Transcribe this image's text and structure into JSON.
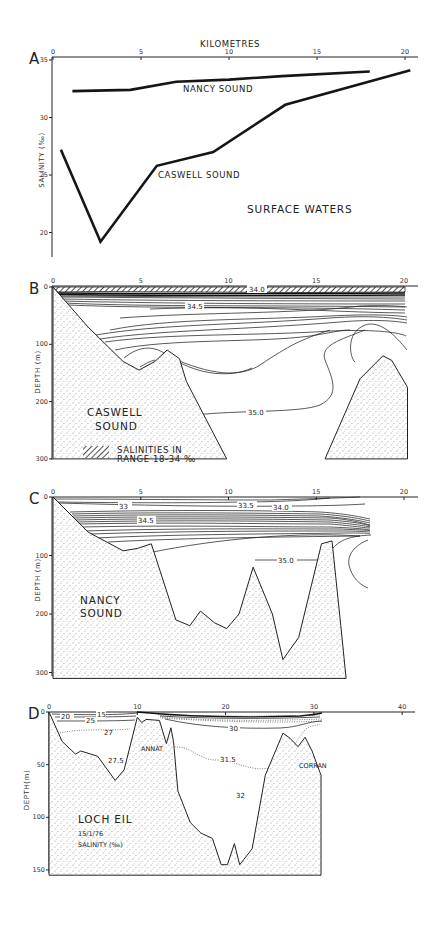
{
  "figure": {
    "panels": [
      "A",
      "B",
      "C",
      "D"
    ]
  },
  "chart_data": [
    {
      "panel": "A",
      "type": "line",
      "title": "SURFACE WATERS",
      "xlabel": "KILOMETRES",
      "ylabel": "SALINITY (‰)",
      "xlim": [
        0,
        21
      ],
      "ylim": [
        18,
        35
      ],
      "x_ticks": [
        "0",
        "5",
        "10",
        "15",
        "20"
      ],
      "y_ticks": [
        "35",
        "30",
        "25",
        "20"
      ],
      "grid": false,
      "series": [
        {
          "name": "NANCY SOUND",
          "x": [
            1.1,
            4.4,
            7.0,
            10.0,
            13.0,
            18.0
          ],
          "y": [
            32.3,
            32.4,
            33.1,
            33.3,
            33.6,
            34.0
          ]
        },
        {
          "name": "CASWELL SOUND",
          "x": [
            0.45,
            2.7,
            5.9,
            9.1,
            13.2,
            20.3
          ],
          "y": [
            27.2,
            19.2,
            25.8,
            27.0,
            31.1,
            34.1
          ]
        }
      ]
    },
    {
      "panel": "B",
      "type": "section",
      "title": "CASWELL SOUND",
      "xlabel": "KILOMETRES",
      "ylabel": "DEPTH (m)",
      "xlim": [
        0,
        21
      ],
      "ylim": [
        0,
        300
      ],
      "x_ticks": [
        "0",
        "5",
        "10",
        "15",
        "20"
      ],
      "y_ticks": [
        "0",
        "100",
        "200",
        "300"
      ],
      "isohaline_labels": [
        "34.0",
        "34.5",
        "35.0"
      ],
      "legend": {
        "hatch_label_line1": "SALINITIES IN",
        "hatch_label_line2": "RANGE 18-34 ‰"
      },
      "bathymetry": {
        "x": [
          0,
          2,
          4,
          4.9,
          5.8,
          6.5,
          7.2,
          7.6,
          9.9
        ],
        "depth": [
          0,
          70,
          130,
          145,
          130,
          110,
          125,
          165,
          300
        ]
      },
      "sill_2": {
        "x": [
          15.5,
          17.5,
          18.8,
          19.3,
          20.2
        ],
        "depth": [
          300,
          160,
          120,
          128,
          175
        ]
      }
    },
    {
      "panel": "C",
      "type": "section",
      "title": "NANCY SOUND",
      "xlabel": "KILOMETRES",
      "ylabel": "DEPTH (m)",
      "xlim": [
        0,
        21
      ],
      "ylim": [
        0,
        300
      ],
      "x_ticks": [
        "0",
        "5",
        "10",
        "15",
        "20"
      ],
      "y_ticks": [
        "0",
        "100",
        "200",
        "300"
      ],
      "isohaline_labels": [
        "33",
        "33.5",
        "34.0",
        "34.5",
        "35.0"
      ],
      "bathymetry": {
        "x": [
          0,
          2,
          4,
          4.8,
          5.6,
          7,
          7.8,
          8.4,
          9.2,
          9.9,
          10.6,
          11.4,
          12.5,
          13.1,
          14,
          15.3,
          15.9,
          16.4,
          16.7
        ],
        "depth": [
          0,
          60,
          92,
          88,
          80,
          210,
          220,
          195,
          215,
          225,
          200,
          120,
          200,
          278,
          240,
          80,
          75,
          220,
          310
        ]
      }
    },
    {
      "panel": "D",
      "type": "section",
      "title": "LOCH EIL",
      "subtitle": "15/1/76",
      "caption": "SALINITY (‰)",
      "xlabel": "",
      "ylabel": "DEPTH(m)",
      "xlim": [
        0,
        42
      ],
      "ylim": [
        0,
        155
      ],
      "x_ticks": [
        "0",
        "10",
        "20",
        "30",
        "40"
      ],
      "y_ticks": [
        "0",
        "50",
        "100",
        "150"
      ],
      "isohaline_labels": [
        "15",
        "20",
        "25",
        "27",
        "27.5",
        "30",
        "31.5",
        "32"
      ],
      "place_labels": [
        "ANNAT",
        "CORRAN"
      ],
      "bathymetry": {
        "x": [
          0,
          1.5,
          3,
          3.6,
          5.5,
          7.5,
          8.5,
          10,
          10.5,
          11,
          12.5,
          13.3,
          13.8,
          14.1,
          14.6,
          16,
          17.2,
          18.5,
          19.5,
          20.2,
          21,
          21.6,
          23,
          24.5,
          26.5,
          27.3,
          28.2,
          29,
          29.8,
          30.8
        ],
        "depth": [
          0,
          28,
          40,
          37,
          42,
          65,
          55,
          5,
          10,
          7,
          8,
          30,
          15,
          28,
          75,
          105,
          115,
          120,
          145,
          145,
          125,
          145,
          130,
          60,
          20,
          25,
          33,
          24,
          37,
          60
        ]
      }
    }
  ]
}
